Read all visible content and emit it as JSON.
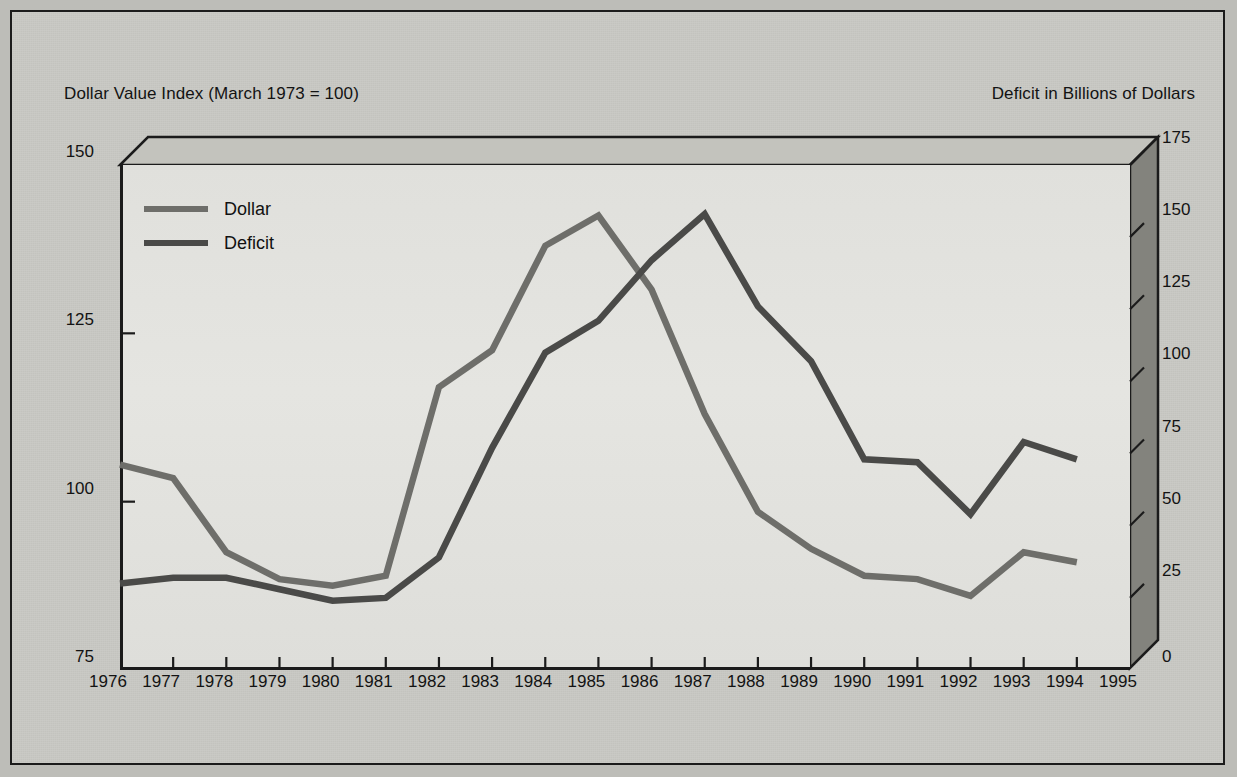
{
  "figure": {
    "left_axis_title": "Dollar Value Index (March 1973 = 100)",
    "right_axis_title": "Deficit in Billions of Dollars"
  },
  "legend": {
    "position": "top-left-inside",
    "items": [
      {
        "label": "Dollar",
        "color": "#6e6e6a"
      },
      {
        "label": "Deficit",
        "color": "#4a4a48"
      }
    ]
  },
  "colors": {
    "dollar_line": "#6e6e6a",
    "deficit_line": "#4a4a48",
    "plot_background": "#e2e2de",
    "frame": "#1b1b1b",
    "wall": "#84847e",
    "page": "#c9c9c4"
  },
  "chart_data": {
    "type": "line",
    "title": "",
    "xlabel": "",
    "ylabel": "Dollar Value Index (March 1973 = 100)",
    "y2label": "Deficit in Billions of Dollars",
    "grid": false,
    "legend_position": "upper left",
    "x": [
      1976,
      1977,
      1978,
      1979,
      1980,
      1981,
      1982,
      1983,
      1984,
      1985,
      1986,
      1987,
      1988,
      1989,
      1990,
      1991,
      1992,
      1993,
      1994,
      1995
    ],
    "xtick_labels": [
      "1976",
      "1977",
      "1978",
      "1979",
      "1980",
      "1981",
      "1982",
      "1983",
      "1984",
      "1985",
      "1986",
      "1987",
      "1988",
      "1989",
      "1990",
      "1991",
      "1992",
      "1993",
      "1994",
      "1995"
    ],
    "xlim": [
      1976,
      1995
    ],
    "ylim": [
      75,
      150
    ],
    "ytick_labels": [
      "75",
      "100",
      "125",
      "150"
    ],
    "yticks": [
      75,
      100,
      125,
      150
    ],
    "y2lim": [
      0,
      175
    ],
    "y2tick_labels": [
      "0",
      "25",
      "50",
      "75",
      "100",
      "125",
      "150",
      "175"
    ],
    "y2ticks": [
      0,
      25,
      50,
      75,
      100,
      125,
      150,
      175
    ],
    "series": [
      {
        "name": "Dollar",
        "axis": "left",
        "units": "index (March 1973 = 100)",
        "x": [
          1976,
          1977,
          1978,
          1979,
          1980,
          1981,
          1982,
          1983,
          1984,
          1985,
          1986,
          1987,
          1988,
          1989,
          1990,
          1991,
          1992,
          1993,
          1994
        ],
        "values": [
          105.5,
          103.5,
          92.5,
          88.5,
          87.5,
          89.0,
          117.0,
          122.5,
          138.0,
          142.5,
          131.5,
          113.0,
          98.5,
          93.0,
          89.0,
          88.5,
          86.0,
          92.5,
          91.0
        ]
      },
      {
        "name": "Deficit",
        "axis": "right",
        "units": "billions of dollars",
        "x": [
          1976,
          1977,
          1978,
          1979,
          1980,
          1981,
          1982,
          1983,
          1984,
          1985,
          1986,
          1987,
          1988,
          1989,
          1990,
          1991,
          1992,
          1993,
          1994
        ],
        "values": [
          30,
          32,
          32,
          28,
          24,
          25,
          39,
          77,
          110,
          121,
          142,
          158,
          126,
          107,
          73,
          72,
          54,
          79,
          73
        ]
      }
    ]
  }
}
